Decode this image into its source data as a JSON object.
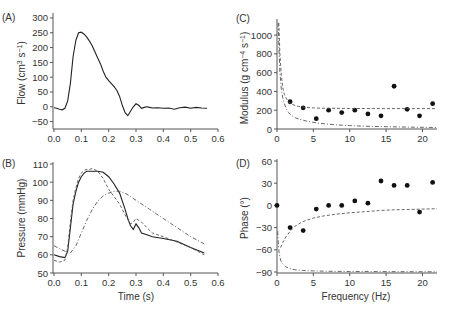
{
  "chart_data": [
    {
      "panel": "(A)",
      "type": "line",
      "xlabel": "",
      "ylabel": "Flow (cm3 s-1)",
      "xlim": [
        0,
        0.6
      ],
      "ylim": [
        -75,
        310
      ],
      "xticks": [
        "0.0",
        "0.1",
        "0.2",
        "0.3",
        "0.4",
        "0.5",
        "0.6"
      ],
      "yticks": [
        "-50",
        "0",
        "50",
        "100",
        "150",
        "200",
        "250",
        "300"
      ],
      "series": [
        {
          "name": "Measured flow",
          "style": "solid",
          "x": [
            0,
            0.01,
            0.02,
            0.03,
            0.04,
            0.05,
            0.06,
            0.07,
            0.08,
            0.09,
            0.1,
            0.11,
            0.12,
            0.13,
            0.14,
            0.15,
            0.16,
            0.17,
            0.18,
            0.19,
            0.2,
            0.21,
            0.22,
            0.23,
            0.24,
            0.25,
            0.26,
            0.27,
            0.28,
            0.29,
            0.3,
            0.31,
            0.32,
            0.33,
            0.34,
            0.35,
            0.36,
            0.38,
            0.4,
            0.42,
            0.44,
            0.46,
            0.48,
            0.5,
            0.52,
            0.54,
            0.56
          ],
          "y": [
            -3,
            -5,
            -8,
            -10,
            -5,
            20,
            80,
            170,
            225,
            250,
            252,
            245,
            235,
            222,
            205,
            185,
            165,
            145,
            120,
            100,
            88,
            78,
            68,
            55,
            35,
            5,
            -20,
            -30,
            -15,
            0,
            10,
            5,
            -5,
            -2,
            0,
            -2,
            -4,
            -3,
            -5,
            -4,
            -8,
            -3,
            -1,
            -5,
            -2,
            -4,
            -5
          ]
        }
      ]
    },
    {
      "panel": "(B)",
      "type": "line",
      "xlabel": "Time (s)",
      "ylabel": "Pressure (mmHg)",
      "xlim": [
        0,
        0.6
      ],
      "ylim": [
        50,
        110
      ],
      "xticks": [
        "0.0",
        "0.1",
        "0.2",
        "0.3",
        "0.4",
        "0.5",
        "0.6"
      ],
      "yticks": [
        "50",
        "60",
        "70",
        "80",
        "90",
        "100",
        "110"
      ],
      "series": [
        {
          "name": "Measured",
          "style": "solid",
          "x": [
            0,
            0.02,
            0.04,
            0.05,
            0.06,
            0.07,
            0.08,
            0.09,
            0.1,
            0.11,
            0.12,
            0.14,
            0.16,
            0.18,
            0.2,
            0.22,
            0.24,
            0.26,
            0.27,
            0.28,
            0.29,
            0.3,
            0.31,
            0.32,
            0.34,
            0.36,
            0.4,
            0.45,
            0.5,
            0.55
          ],
          "y": [
            60,
            59,
            58.5,
            62,
            75,
            88,
            95,
            100,
            103,
            105,
            106,
            106,
            106,
            105.5,
            103,
            99,
            94,
            85,
            80,
            76,
            74,
            77,
            75,
            72,
            71,
            70,
            69,
            67.5,
            64,
            61
          ]
        },
        {
          "name": "Model 1",
          "style": "dashed",
          "x": [
            0,
            0.02,
            0.04,
            0.05,
            0.06,
            0.07,
            0.08,
            0.09,
            0.1,
            0.11,
            0.12,
            0.13,
            0.14,
            0.16,
            0.18,
            0.2,
            0.22,
            0.24,
            0.26,
            0.28,
            0.29,
            0.3,
            0.31,
            0.32,
            0.34,
            0.36,
            0.4,
            0.45,
            0.5,
            0.55
          ],
          "y": [
            57,
            56,
            57,
            64,
            78,
            90,
            97,
            102,
            105,
            106.5,
            107,
            107,
            107.5,
            106,
            102,
            96,
            92,
            88,
            82,
            77,
            78,
            80,
            79,
            78,
            75,
            72,
            70,
            67,
            64,
            60
          ]
        },
        {
          "name": "Model 2",
          "style": "dashdot",
          "x": [
            0,
            0.02,
            0.04,
            0.05,
            0.06,
            0.08,
            0.1,
            0.12,
            0.14,
            0.16,
            0.18,
            0.2,
            0.22,
            0.24,
            0.26,
            0.28,
            0.3,
            0.35,
            0.4,
            0.45,
            0.5,
            0.55
          ],
          "y": [
            65,
            63.5,
            62,
            61,
            61,
            65,
            72,
            79,
            85,
            89.5,
            92.5,
            94,
            95,
            95,
            94,
            92,
            90,
            85,
            80,
            75,
            70,
            66
          ]
        }
      ]
    },
    {
      "panel": "(C)",
      "type": "scatter",
      "xlabel": "",
      "ylabel": "Modulus (g cm-4 s-1)",
      "xlim": [
        0,
        22
      ],
      "ylim": [
        0,
        1150
      ],
      "xticks": [
        "0",
        "5",
        "10",
        "15",
        "20"
      ],
      "yticks": [
        "0",
        "200",
        "400",
        "600",
        "800",
        "1000"
      ],
      "series": [
        {
          "name": "Measured",
          "style": "points",
          "x": [
            1.8,
            3.6,
            5.4,
            7.1,
            8.9,
            10.7,
            12.5,
            14.3,
            16.1,
            17.9,
            19.6,
            21.4
          ],
          "y": [
            290,
            225,
            110,
            200,
            175,
            200,
            160,
            140,
            455,
            210,
            140,
            270
          ]
        },
        {
          "name": "Model 1",
          "style": "dashed",
          "x": [
            0.25,
            0.4,
            0.6,
            0.8,
            1.0,
            1.3,
            1.6,
            2,
            2.5,
            3,
            4,
            5,
            6,
            8,
            10,
            12,
            15,
            18,
            22
          ],
          "y": [
            1130,
            800,
            560,
            440,
            370,
            320,
            290,
            265,
            250,
            240,
            230,
            225,
            222,
            220,
            218,
            218,
            217,
            217,
            217
          ]
        },
        {
          "name": "Model 2",
          "style": "dashdot",
          "x": [
            0.15,
            0.25,
            0.4,
            0.6,
            0.8,
            1,
            1.3,
            1.6,
            2,
            2.5,
            3,
            4,
            5,
            6,
            8,
            10,
            12,
            15,
            18,
            22
          ],
          "y": [
            1130,
            900,
            600,
            420,
            330,
            270,
            210,
            175,
            145,
            120,
            105,
            85,
            70,
            60,
            45,
            36,
            30,
            24,
            20,
            16
          ]
        }
      ]
    },
    {
      "panel": "(D)",
      "type": "scatter",
      "xlabel": "Frequency (Hz)",
      "ylabel": "Phase (°)",
      "xlim": [
        0,
        22
      ],
      "ylim": [
        -90,
        60
      ],
      "xticks": [
        "0",
        "5",
        "10",
        "15",
        "20"
      ],
      "yticks": [
        "-90",
        "-60",
        "-30",
        "0",
        "30",
        "60"
      ],
      "series": [
        {
          "name": "Measured",
          "style": "points",
          "x": [
            0,
            1.8,
            3.6,
            5.4,
            7.1,
            8.9,
            10.7,
            12.5,
            14.3,
            16.1,
            17.9,
            19.6,
            21.4
          ],
          "y": [
            0,
            -30,
            -34,
            -5,
            0,
            0,
            6,
            3,
            33,
            27,
            27,
            -9,
            31
          ]
        },
        {
          "name": "Model 1",
          "style": "dashed",
          "x": [
            0.5,
            0.8,
            1.2,
            1.8,
            2.5,
            3.5,
            5,
            6.5,
            8,
            10,
            12,
            14,
            16,
            18,
            20,
            22
          ],
          "y": [
            -57,
            -50,
            -43,
            -35,
            -28,
            -22,
            -17,
            -14,
            -12,
            -10,
            -8.5,
            -7,
            -6,
            -5.5,
            -5,
            -4.5
          ]
        },
        {
          "name": "Model 2",
          "style": "dashdot",
          "x": [
            0.1,
            0.2,
            0.3,
            0.5,
            0.8,
            1.2,
            1.8,
            2.5,
            3.5,
            5,
            7,
            10,
            14,
            18,
            22
          ],
          "y": [
            -35,
            -55,
            -65,
            -74,
            -79,
            -83,
            -85.5,
            -87,
            -88,
            -88.5,
            -89,
            -89.3,
            -89.5,
            -89.6,
            -89.7
          ]
        }
      ]
    }
  ],
  "panels": {
    "a": {
      "label": "(A)",
      "ylabel": "Flow (cm",
      "ylabel_sup1": "3",
      "ylabel_mid": " s",
      "ylabel_sup2": "−1",
      "ylabel_end": ")"
    },
    "b": {
      "label": "(B)",
      "ylabel": "Pressure (mmHg)",
      "xlabel": "Time (s)"
    },
    "c": {
      "label": "(C)",
      "ylabel": "Modulus (g cm",
      "ylabel_sup1": "−4",
      "ylabel_mid": " s",
      "ylabel_sup2": "−1",
      "ylabel_end": ")"
    },
    "d": {
      "label": "(D)",
      "ylabel": "Phase (°)",
      "xlabel": "Frequency (Hz)"
    }
  }
}
